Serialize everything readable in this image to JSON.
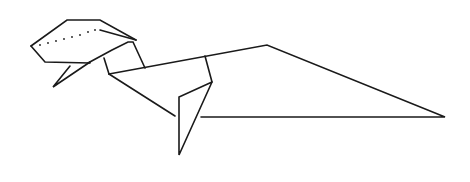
{
  "figure": {
    "stroke_color": "#1a1a1a",
    "background": "#ffffff",
    "width": 470,
    "height": 182
  },
  "parts": {
    "head_outline": "31,46 67,20 100,20 136,40",
    "head_inner_fold": "100,30 136,40",
    "head_lower": "31,46 45,62 90,63",
    "jaw": "70,66 53,87 90,62",
    "neck_top": "88,63 112,50 128,42 133,42 145,68",
    "neck_vertical": "104,58 109,74",
    "back": "109,74 267,45 445,117 201,117",
    "neck_underside": "109,74 175,116",
    "leg_fold": "205,56 212,82",
    "leg": "212,82 179,97 179,155 212,82",
    "eye_dots": [
      [
        40,
        45
      ],
      [
        48,
        43
      ],
      [
        56,
        41
      ],
      [
        64,
        39
      ],
      [
        72,
        37
      ],
      [
        80,
        35
      ],
      [
        88,
        32
      ],
      [
        95,
        30
      ]
    ]
  }
}
